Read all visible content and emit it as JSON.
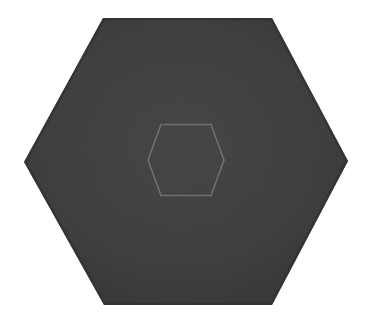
{
  "canvas": {
    "width": 377,
    "height": 327,
    "background_color": "#ffffff",
    "description": "Dark gray flat-top hexagon centered on a white background, with a small lighter-gray hexagon outline near its center"
  },
  "shapes": {
    "outer_hexagon": {
      "name": "outer-hexagon",
      "orientation": "flat-top",
      "fill_color": "#3d3d3d",
      "fill_color_light": "#434343",
      "fill_color_dark": "#333333",
      "edge_shade_color": "#2e2e2e",
      "stroke_color": "none",
      "stroke_width": 0,
      "center_x": 186,
      "center_y": 161.5,
      "width": 324,
      "height": 287,
      "points": "103,18 272,18 348,161 272,305 104,305 24,162",
      "vertices": [
        {
          "x": 103,
          "y": 18
        },
        {
          "x": 272,
          "y": 18
        },
        {
          "x": 348,
          "y": 161
        },
        {
          "x": 272,
          "y": 305
        },
        {
          "x": 104,
          "y": 305
        },
        {
          "x": 24,
          "y": 162
        }
      ]
    },
    "inner_hexagon": {
      "name": "inner-hexagon",
      "orientation": "flat-top",
      "fill_color": "none",
      "stroke_color": "#6b6b6b",
      "stroke_width": 1.6,
      "center_x": 186,
      "center_y": 160,
      "width": 78,
      "height": 72,
      "points": "161,124.5 211,124.5 224,160 211,195.5 161,195.5 148,160",
      "vertices": [
        {
          "x": 161,
          "y": 124.5
        },
        {
          "x": 211,
          "y": 124.5
        },
        {
          "x": 224,
          "y": 160
        },
        {
          "x": 211,
          "y": 195.5
        },
        {
          "x": 161,
          "y": 195.5
        },
        {
          "x": 148,
          "y": 160
        }
      ]
    }
  },
  "texture": {
    "name": "grain-noise",
    "type": "fractal-noise",
    "base_frequency": 0.85,
    "octaves": 3,
    "opacity": 0.55
  }
}
